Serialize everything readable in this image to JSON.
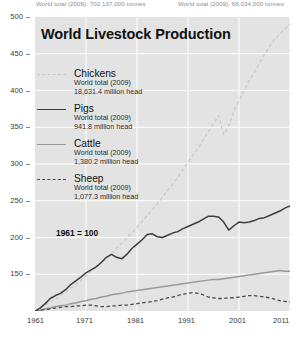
{
  "top_notes": {
    "left": "World total (2009): 702,137,000 tonnes",
    "right": "World total (2009): 68,034,000 tonnes"
  },
  "title": "World Livestock Production",
  "baseline_note": "1961 = 100",
  "legend": [
    {
      "name": "Chickens",
      "sub1": "World total (2009)",
      "sub2": "18,631.4 million head",
      "color": "#c9c9c9",
      "style": "dashed"
    },
    {
      "name": "Pigs",
      "sub1": "World total (2009)",
      "sub2": "941.8 million head",
      "color": "#3d3d3d",
      "style": "solid"
    },
    {
      "name": "Cattle",
      "sub1": "World total (2009)",
      "sub2": "1,380.2 million head",
      "color": "#9a9a9a",
      "style": "solid"
    },
    {
      "name": "Sheep",
      "sub1": "World total (2009)",
      "sub2": "1,077.3 million head",
      "color": "#4a4a4a",
      "style": "dashed"
    }
  ],
  "chart_data": {
    "type": "line",
    "title": "World Livestock Production",
    "xlabel": "",
    "ylabel": "",
    "xlim": [
      1961,
      2011
    ],
    "ylim": [
      100,
      500
    ],
    "yticks": [
      150,
      200,
      250,
      300,
      350,
      400,
      450,
      500
    ],
    "xticks": [
      1961,
      1971,
      1981,
      1991,
      2001,
      2011
    ],
    "grid": true,
    "legend_position": "inside-top-left",
    "annotation": "1961 = 100",
    "note": "Index, 1961 = 100",
    "x": [
      1961,
      1962,
      1963,
      1964,
      1965,
      1966,
      1967,
      1968,
      1969,
      1970,
      1971,
      1972,
      1973,
      1974,
      1975,
      1976,
      1977,
      1978,
      1979,
      1980,
      1981,
      1982,
      1983,
      1984,
      1985,
      1986,
      1987,
      1988,
      1989,
      1990,
      1991,
      1992,
      1993,
      1994,
      1995,
      1996,
      1997,
      1998,
      1999,
      2000,
      2001,
      2002,
      2003,
      2004,
      2005,
      2006,
      2007,
      2008,
      2009,
      2010,
      2011
    ],
    "series": [
      {
        "name": "Chickens",
        "color": "#c9c9c9",
        "style": "dashed",
        "values": [
          100,
          104,
          108,
          112,
          116,
          121,
          126,
          131,
          136,
          142,
          148,
          154,
          160,
          166,
          172,
          178,
          185,
          192,
          199,
          206,
          214,
          222,
          230,
          238,
          246,
          255,
          264,
          273,
          282,
          292,
          302,
          312,
          322,
          333,
          344,
          355,
          366,
          340,
          352,
          372,
          386,
          400,
          413,
          425,
          437,
          449,
          460,
          470,
          477,
          484,
          490
        ]
      },
      {
        "name": "Pigs",
        "color": "#3d3d3d",
        "style": "solid",
        "values": [
          100,
          104,
          110,
          117,
          121,
          124,
          129,
          136,
          141,
          146,
          152,
          156,
          160,
          166,
          173,
          177,
          173,
          171,
          177,
          185,
          191,
          197,
          204,
          205,
          201,
          200,
          203,
          206,
          208,
          212,
          215,
          218,
          221,
          225,
          229,
          229,
          228,
          221,
          210,
          216,
          221,
          220,
          221,
          223,
          226,
          227,
          230,
          233,
          236,
          240,
          243
        ]
      },
      {
        "name": "Cattle",
        "color": "#9a9a9a",
        "style": "solid",
        "values": [
          100,
          101,
          103,
          104,
          106,
          107,
          108,
          110,
          111,
          113,
          114,
          116,
          117,
          119,
          120,
          122,
          123,
          124,
          126,
          127,
          128,
          129,
          130,
          131,
          132,
          133,
          134,
          135,
          136,
          137,
          138,
          139,
          140,
          141,
          142,
          143,
          143,
          144,
          145,
          146,
          147,
          148,
          149,
          150,
          151,
          152,
          153,
          154,
          155,
          154,
          154
        ]
      },
      {
        "name": "Sheep",
        "color": "#4a4a4a",
        "style": "dashed",
        "values": [
          100,
          101,
          102,
          103,
          104,
          105,
          106,
          106,
          107,
          107,
          108,
          108,
          107,
          106,
          106,
          107,
          107,
          108,
          108,
          109,
          110,
          111,
          112,
          113,
          114,
          116,
          118,
          119,
          121,
          123,
          124,
          125,
          124,
          122,
          119,
          118,
          117,
          117,
          118,
          118,
          119,
          120,
          121,
          121,
          120,
          119,
          118,
          116,
          114,
          113,
          112
        ]
      }
    ]
  }
}
